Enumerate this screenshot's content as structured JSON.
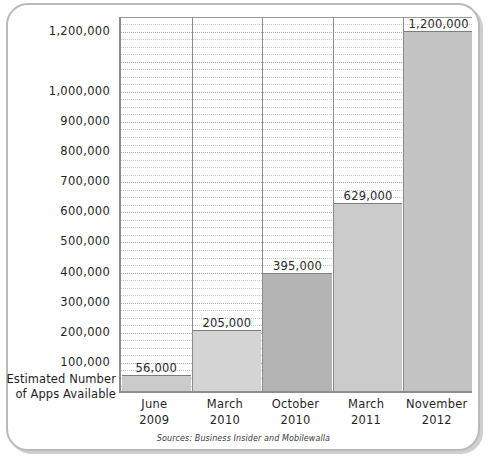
{
  "chart_data": {
    "type": "bar",
    "title": "",
    "subtitle": "",
    "xlabel": "",
    "ylabel": "Estimated Number of Apps Available",
    "ylabel_line1": "Estimated Number",
    "ylabel_line2": "of Apps Available",
    "categories": [
      "June 2009",
      "March 2010",
      "October 2010",
      "March 2011",
      "November 2012"
    ],
    "category_lines": [
      {
        "line1": "June",
        "line2": "2009"
      },
      {
        "line1": "March",
        "line2": "2010"
      },
      {
        "line1": "October",
        "line2": "2010"
      },
      {
        "line1": "March",
        "line2": "2011"
      },
      {
        "line1": "November",
        "line2": "2012"
      }
    ],
    "values": [
      56000,
      205000,
      395000,
      629000,
      1200000
    ],
    "value_labels": [
      "56,000",
      "205,000",
      "395,000",
      "629,000",
      "1,200,000"
    ],
    "bar_colors": [
      "#cbcbcb",
      "#d4d4d4",
      "#b4b4b4",
      "#cbcbcb",
      "#c4c4c4"
    ],
    "ylim": [
      0,
      1245000
    ],
    "ytick_values": [
      100000,
      200000,
      300000,
      400000,
      500000,
      600000,
      700000,
      800000,
      900000,
      1000000,
      1200000
    ],
    "ytick_labels": [
      "100,000",
      "200,000",
      "300,000",
      "400,000",
      "500,000",
      "600,000",
      "700,000",
      "800,000",
      "900,000",
      "1,000,000",
      "1,200,000"
    ],
    "gridlines": true,
    "gridline_style": "dotted",
    "minor_gridline_step": 25000,
    "legend": "none",
    "source_note": "Sources: Business Insider and Mobilewalla",
    "axis_color": "#8d8d8d",
    "grid_color": "#c6c6c6",
    "text_color": "#1f1f1f",
    "plot_background": "#ffffff"
  },
  "card": {
    "border_color": "#b9b9b9",
    "shadow_color": "#cfcfcf"
  }
}
